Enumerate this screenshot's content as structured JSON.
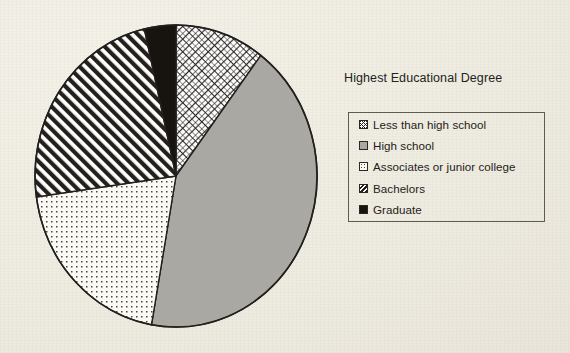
{
  "chart_data": {
    "type": "pie",
    "title": "Highest Educational Degree",
    "xlabel": "",
    "ylabel": "",
    "legend_position": "right",
    "grid": false,
    "categories": [
      "Less than high school",
      "High school",
      "Associates or junior college",
      "Bachelors",
      "Graduate"
    ],
    "values": [
      10,
      43,
      20,
      23,
      4
    ],
    "units": "percent",
    "start_angle_deg": 0,
    "direction": "clockwise",
    "slices": [
      {
        "label": "Less than high school",
        "value": 10,
        "start_angle_deg": 0,
        "end_angle_deg": 37,
        "pattern": "crosshatch-diagonal",
        "fill": "#ffffff",
        "stroke": "#231f1c"
      },
      {
        "label": "High school",
        "value": 43,
        "start_angle_deg": 37,
        "end_angle_deg": 190,
        "pattern": "solid-gray",
        "fill": "#a9a8a2",
        "stroke": "#231f1c"
      },
      {
        "label": "Associates or junior college",
        "value": 20,
        "start_angle_deg": 190,
        "end_angle_deg": 262,
        "pattern": "fine-dots",
        "fill": "#fbfaf5",
        "stroke": "#231f1c"
      },
      {
        "label": "Bachelors",
        "value": 23,
        "start_angle_deg": 262,
        "end_angle_deg": 347,
        "pattern": "diagonal-hatch",
        "fill": "#ffffff",
        "stroke": "#231f1c"
      },
      {
        "label": "Graduate",
        "value": 4,
        "start_angle_deg": 347,
        "end_angle_deg": 360,
        "pattern": "solid-black",
        "fill": "#17140f",
        "stroke": "#231f1c"
      }
    ]
  },
  "legend": {
    "title": "Highest Educational Degree",
    "items": [
      {
        "label": "Less than high school",
        "pattern": "crosshatch-diagonal"
      },
      {
        "label": "High school",
        "pattern": "solid-gray"
      },
      {
        "label": "Associates or junior college",
        "pattern": "fine-dots"
      },
      {
        "label": "Bachelors",
        "pattern": "diagonal-hatch"
      },
      {
        "label": "Graduate",
        "pattern": "solid-black"
      }
    ]
  },
  "colors": {
    "background": "#efece3",
    "outline": "#231f1c",
    "gray_slice": "#a9a8a2",
    "black_slice": "#17140f",
    "legend_border": "#5d5953",
    "text": "#1f1c19"
  }
}
